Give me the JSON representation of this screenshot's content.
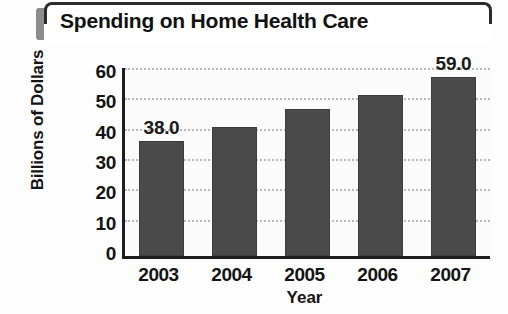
{
  "chart_data": {
    "type": "bar",
    "title": "Spending on Home Health Care",
    "xlabel": "Year",
    "ylabel": "Billions of Dollars",
    "categories": [
      "2003",
      "2004",
      "2005",
      "2006",
      "2007"
    ],
    "values": [
      38.0,
      42.5,
      48.5,
      53.0,
      59.0
    ],
    "point_labels": [
      "38.0",
      "",
      "",
      "",
      "59.0"
    ],
    "ylim": [
      0,
      60
    ],
    "yticks": [
      60,
      50,
      40,
      30,
      20,
      10,
      0
    ],
    "ytick_labels": [
      "60",
      "50",
      "40",
      "30",
      "20",
      "10",
      "0"
    ],
    "grid": "horizontal-dotted",
    "legend": "none",
    "bar_color": "#4a4a4a",
    "plot_background": "#fbfbfb",
    "axis_color": "#1d1d1d",
    "title_accent_color": "#8d8d8d",
    "title_border_color": "#2b2b2b"
  }
}
